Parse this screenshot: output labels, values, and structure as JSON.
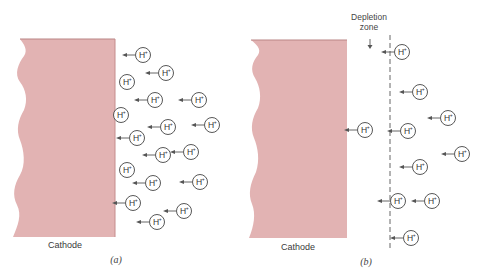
{
  "colors": {
    "cathode_fill": "#e2b3b3",
    "cathode_edge": "#c58c8c",
    "ion_stroke": "#444444",
    "arrow": "#555555",
    "dashed_line": "#555555"
  },
  "panel_a": {
    "label": "(a)",
    "cathode_label": "Cathode",
    "ion_label": "H+",
    "ions": [
      {
        "x": 143,
        "y": 55,
        "arrow": true
      },
      {
        "x": 166,
        "y": 73,
        "arrow": true
      },
      {
        "x": 127,
        "y": 82,
        "arrow": false
      },
      {
        "x": 155,
        "y": 100,
        "arrow": true
      },
      {
        "x": 199,
        "y": 100,
        "arrow": true
      },
      {
        "x": 121,
        "y": 115,
        "arrow": false
      },
      {
        "x": 168,
        "y": 127,
        "arrow": true
      },
      {
        "x": 212,
        "y": 125,
        "arrow": true
      },
      {
        "x": 137,
        "y": 138,
        "arrow": true
      },
      {
        "x": 163,
        "y": 155,
        "arrow": true
      },
      {
        "x": 191,
        "y": 152,
        "arrow": true
      },
      {
        "x": 127,
        "y": 170,
        "arrow": false
      },
      {
        "x": 153,
        "y": 183,
        "arrow": true
      },
      {
        "x": 200,
        "y": 182,
        "arrow": true
      },
      {
        "x": 133,
        "y": 203,
        "arrow": true
      },
      {
        "x": 184,
        "y": 211,
        "arrow": true
      },
      {
        "x": 157,
        "y": 222,
        "arrow": true
      }
    ]
  },
  "panel_b": {
    "label": "(b)",
    "cathode_label": "Cathode",
    "depletion_label_line1": "Depletion",
    "depletion_label_line2": "zone",
    "ion_label": "H+",
    "ions": [
      {
        "x": 402,
        "y": 52,
        "arrow": true
      },
      {
        "x": 420,
        "y": 92,
        "arrow": true
      },
      {
        "x": 448,
        "y": 118,
        "arrow": true
      },
      {
        "x": 365,
        "y": 130,
        "arrow": true
      },
      {
        "x": 408,
        "y": 131,
        "arrow": true
      },
      {
        "x": 462,
        "y": 154,
        "arrow": true
      },
      {
        "x": 420,
        "y": 167,
        "arrow": true
      },
      {
        "x": 398,
        "y": 201,
        "arrow": true
      },
      {
        "x": 432,
        "y": 201,
        "arrow": true
      },
      {
        "x": 411,
        "y": 238,
        "arrow": true
      }
    ]
  }
}
